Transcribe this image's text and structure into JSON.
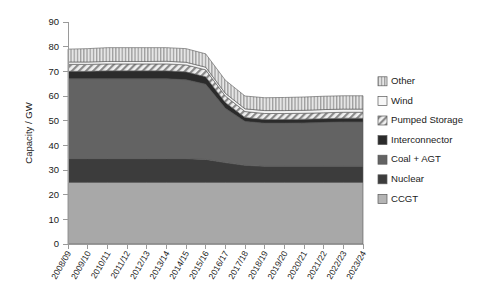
{
  "chart_data": {
    "type": "area",
    "stacked": true,
    "title": "",
    "xlabel": "",
    "ylabel": "Capacity / GW",
    "ylim": [
      0,
      90
    ],
    "ytick_step": 10,
    "yticks": [
      0,
      10,
      20,
      30,
      40,
      50,
      60,
      70,
      80,
      90
    ],
    "grid": false,
    "legend_position": "right",
    "categories": [
      "2008/09",
      "2009/10",
      "2010/11",
      "2011/12",
      "2012/13",
      "2013/14",
      "2014/15",
      "2015/16",
      "2016/17",
      "2017/18",
      "2018/19",
      "2019/20",
      "2020/21",
      "2021/22",
      "2022/23",
      "2023/24"
    ],
    "series": [
      {
        "name": "CCGT",
        "fill": "#a8a8a8",
        "pattern": "solid",
        "values": [
          25.0,
          25.0,
          25.0,
          25.0,
          25.0,
          25.0,
          25.0,
          25.0,
          25.0,
          25.0,
          25.0,
          25.0,
          25.0,
          25.0,
          25.0,
          25.0
        ]
      },
      {
        "name": "Nuclear",
        "fill": "#3c3c3c",
        "pattern": "solid",
        "values": [
          9.6,
          9.6,
          9.6,
          9.6,
          9.6,
          9.6,
          9.6,
          9.3,
          8.0,
          6.9,
          6.5,
          6.5,
          6.5,
          6.5,
          6.5,
          6.5
        ]
      },
      {
        "name": "Coal + AGT",
        "fill": "#636363",
        "pattern": "solid",
        "values": [
          32.4,
          32.4,
          32.4,
          32.4,
          32.4,
          32.4,
          32.0,
          30.5,
          22.0,
          17.8,
          17.5,
          17.5,
          17.6,
          17.8,
          18.0,
          18.0
        ]
      },
      {
        "name": "Interconnector",
        "fill": "#2b2b2b",
        "pattern": "solid",
        "values": [
          3.0,
          3.0,
          3.2,
          3.2,
          3.2,
          3.2,
          3.2,
          3.0,
          2.4,
          1.6,
          1.5,
          1.5,
          1.5,
          1.5,
          1.5,
          1.5
        ]
      },
      {
        "name": "Pumped Storage",
        "fill": "#e2e2e2",
        "pattern": "diagonal",
        "values": [
          2.8,
          2.8,
          2.8,
          2.8,
          2.8,
          2.8,
          2.8,
          2.8,
          2.6,
          2.4,
          2.4,
          2.4,
          2.4,
          2.4,
          2.4,
          2.4
        ]
      },
      {
        "name": "Wind",
        "fill": "#f2f2f2",
        "pattern": "solid",
        "values": [
          1.0,
          1.0,
          1.0,
          1.0,
          1.0,
          1.1,
          1.1,
          1.1,
          1.1,
          1.1,
          1.2,
          1.2,
          1.2,
          1.3,
          1.3,
          1.3
        ]
      },
      {
        "name": "Other",
        "fill": "#d0d0d0",
        "pattern": "vertical",
        "values": [
          5.2,
          5.4,
          5.6,
          5.6,
          5.6,
          5.5,
          5.5,
          5.4,
          5.3,
          5.2,
          5.2,
          5.3,
          5.4,
          5.4,
          5.4,
          5.4
        ]
      }
    ],
    "totals": [
      79.0,
      79.2,
      79.6,
      79.6,
      79.6,
      79.5,
      79.1,
      77.1,
      66.4,
      60.0,
      59.3,
      59.4,
      59.6,
      59.9,
      60.1,
      60.1
    ],
    "legend_entries": [
      {
        "label": "Other",
        "swatch": "vertical"
      },
      {
        "label": "Wind",
        "swatch": "light"
      },
      {
        "label": "Pumped Storage",
        "swatch": "diagonal"
      },
      {
        "label": "Interconnector",
        "swatch": "darkest"
      },
      {
        "label": "Coal + AGT",
        "swatch": "mid"
      },
      {
        "label": "Nuclear",
        "swatch": "dark"
      },
      {
        "label": "CCGT",
        "swatch": "lightgrey"
      }
    ]
  }
}
